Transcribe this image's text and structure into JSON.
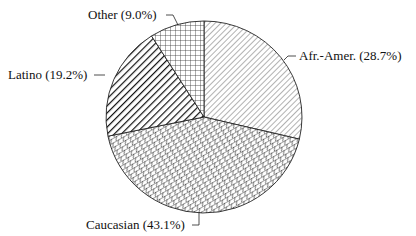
{
  "chart_data": {
    "type": "pie",
    "title": "",
    "start_angle_deg": 90,
    "direction": "clockwise",
    "slices": [
      {
        "label": "Afr.-Amer.",
        "value": 28.7,
        "display": "Afr.-Amer. (28.7%)",
        "pattern": "diagonal-light"
      },
      {
        "label": "Caucasian",
        "value": 43.1,
        "display": "Caucasian (43.1%)",
        "pattern": "crosshatch-diagonal"
      },
      {
        "label": "Latino",
        "value": 19.2,
        "display": "Latino (19.2%)",
        "pattern": "diagonal-heavy"
      },
      {
        "label": "Other",
        "value": 9.0,
        "display": "Other (9.0%)",
        "pattern": "grid"
      }
    ],
    "categories": [
      "Afr.-Amer.",
      "Caucasian",
      "Latino",
      "Other"
    ],
    "values": [
      28.7,
      43.1,
      19.2,
      9.0
    ],
    "legend": "none (callout labels)"
  },
  "labels": {
    "afr_amer": "Afr.-Amer. (28.7%)",
    "caucasian": "Caucasian (43.1%)",
    "latino": "Latino (19.2%)",
    "other": "Other (9.0%)"
  }
}
